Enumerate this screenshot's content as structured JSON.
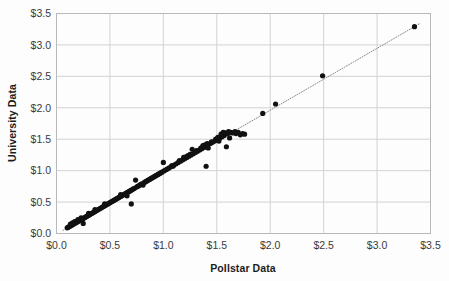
{
  "chart_data": {
    "type": "scatter",
    "title": "",
    "xlabel": "Pollstar Data",
    "ylabel": "University Data",
    "xlim": [
      0.0,
      3.5
    ],
    "ylim": [
      0.0,
      3.5
    ],
    "xticks": [
      0.0,
      0.5,
      1.0,
      1.5,
      2.0,
      2.5,
      3.0,
      3.5
    ],
    "yticks": [
      0.0,
      0.5,
      1.0,
      1.5,
      2.0,
      2.5,
      3.0,
      3.5
    ],
    "xticklabels": [
      "$0.0",
      "$0.5",
      "$1.0",
      "$1.5",
      "$2.0",
      "$2.5",
      "$3.0",
      "$3.5"
    ],
    "yticklabels": [
      "$0.0",
      "$0.5",
      "$1.0",
      "$1.5",
      "$2.0",
      "$2.5",
      "$3.0",
      "$3.5"
    ],
    "grid": true,
    "legend": null,
    "marker_color": "#111111",
    "grid_color": "#d2d2d2",
    "axis_color": "#b9b9b9",
    "trendline": {
      "style": "dotted",
      "color": "#8a8a8a",
      "x": [
        0.06,
        3.4
      ],
      "y": [
        0.05,
        3.34
      ]
    },
    "series": [
      {
        "name": "Ticket price pairs",
        "points": [
          [
            0.1,
            0.09
          ],
          [
            0.11,
            0.1
          ],
          [
            0.12,
            0.11
          ],
          [
            0.13,
            0.12
          ],
          [
            0.13,
            0.15
          ],
          [
            0.14,
            0.13
          ],
          [
            0.15,
            0.14
          ],
          [
            0.15,
            0.17
          ],
          [
            0.16,
            0.15
          ],
          [
            0.17,
            0.16
          ],
          [
            0.17,
            0.19
          ],
          [
            0.18,
            0.17
          ],
          [
            0.19,
            0.18
          ],
          [
            0.2,
            0.19
          ],
          [
            0.2,
            0.22
          ],
          [
            0.21,
            0.2
          ],
          [
            0.22,
            0.21
          ],
          [
            0.23,
            0.22
          ],
          [
            0.23,
            0.25
          ],
          [
            0.24,
            0.23
          ],
          [
            0.25,
            0.16
          ],
          [
            0.25,
            0.24
          ],
          [
            0.26,
            0.25
          ],
          [
            0.27,
            0.26
          ],
          [
            0.28,
            0.27
          ],
          [
            0.29,
            0.28
          ],
          [
            0.3,
            0.29
          ],
          [
            0.3,
            0.32
          ],
          [
            0.31,
            0.3
          ],
          [
            0.32,
            0.31
          ],
          [
            0.33,
            0.32
          ],
          [
            0.34,
            0.33
          ],
          [
            0.35,
            0.34
          ],
          [
            0.36,
            0.35
          ],
          [
            0.36,
            0.38
          ],
          [
            0.37,
            0.36
          ],
          [
            0.38,
            0.37
          ],
          [
            0.39,
            0.38
          ],
          [
            0.4,
            0.39
          ],
          [
            0.41,
            0.4
          ],
          [
            0.42,
            0.41
          ],
          [
            0.43,
            0.42
          ],
          [
            0.44,
            0.43
          ],
          [
            0.45,
            0.44
          ],
          [
            0.45,
            0.47
          ],
          [
            0.46,
            0.45
          ],
          [
            0.47,
            0.46
          ],
          [
            0.48,
            0.47
          ],
          [
            0.49,
            0.48
          ],
          [
            0.5,
            0.49
          ],
          [
            0.51,
            0.5
          ],
          [
            0.52,
            0.51
          ],
          [
            0.53,
            0.52
          ],
          [
            0.54,
            0.53
          ],
          [
            0.55,
            0.54
          ],
          [
            0.56,
            0.55
          ],
          [
            0.57,
            0.56
          ],
          [
            0.58,
            0.57
          ],
          [
            0.59,
            0.58
          ],
          [
            0.6,
            0.59
          ],
          [
            0.6,
            0.62
          ],
          [
            0.61,
            0.6
          ],
          [
            0.62,
            0.61
          ],
          [
            0.63,
            0.62
          ],
          [
            0.64,
            0.63
          ],
          [
            0.65,
            0.64
          ],
          [
            0.66,
            0.6
          ],
          [
            0.66,
            0.65
          ],
          [
            0.67,
            0.66
          ],
          [
            0.68,
            0.67
          ],
          [
            0.69,
            0.68
          ],
          [
            0.7,
            0.47
          ],
          [
            0.7,
            0.69
          ],
          [
            0.71,
            0.7
          ],
          [
            0.72,
            0.71
          ],
          [
            0.73,
            0.72
          ],
          [
            0.74,
            0.85
          ],
          [
            0.75,
            0.74
          ],
          [
            0.76,
            0.75
          ],
          [
            0.77,
            0.76
          ],
          [
            0.78,
            0.77
          ],
          [
            0.79,
            0.78
          ],
          [
            0.8,
            0.79
          ],
          [
            0.81,
            0.77
          ],
          [
            0.82,
            0.81
          ],
          [
            0.83,
            0.82
          ],
          [
            0.84,
            0.83
          ],
          [
            0.85,
            0.84
          ],
          [
            0.86,
            0.85
          ],
          [
            0.87,
            0.86
          ],
          [
            0.88,
            0.87
          ],
          [
            0.89,
            0.88
          ],
          [
            0.9,
            0.89
          ],
          [
            0.91,
            0.9
          ],
          [
            0.92,
            0.91
          ],
          [
            0.93,
            0.92
          ],
          [
            0.94,
            0.93
          ],
          [
            0.95,
            0.94
          ],
          [
            0.96,
            0.95
          ],
          [
            0.97,
            0.96
          ],
          [
            0.98,
            0.97
          ],
          [
            0.99,
            0.98
          ],
          [
            1.0,
            1.13
          ],
          [
            1.01,
            1.0
          ],
          [
            1.03,
            1.02
          ],
          [
            1.05,
            1.04
          ],
          [
            1.07,
            1.06
          ],
          [
            1.08,
            1.08
          ],
          [
            1.09,
            1.07
          ],
          [
            1.1,
            1.09
          ],
          [
            1.12,
            1.11
          ],
          [
            1.14,
            1.13
          ],
          [
            1.15,
            1.16
          ],
          [
            1.16,
            1.15
          ],
          [
            1.18,
            1.17
          ],
          [
            1.19,
            1.21
          ],
          [
            1.2,
            1.19
          ],
          [
            1.21,
            1.22
          ],
          [
            1.22,
            1.21
          ],
          [
            1.23,
            1.24
          ],
          [
            1.24,
            1.23
          ],
          [
            1.25,
            1.26
          ],
          [
            1.26,
            1.25
          ],
          [
            1.27,
            1.34
          ],
          [
            1.28,
            1.27
          ],
          [
            1.3,
            1.29
          ],
          [
            1.31,
            1.32
          ],
          [
            1.32,
            1.31
          ],
          [
            1.34,
            1.33
          ],
          [
            1.35,
            1.36
          ],
          [
            1.36,
            1.35
          ],
          [
            1.37,
            1.4
          ],
          [
            1.38,
            1.37
          ],
          [
            1.39,
            1.41
          ],
          [
            1.4,
            1.07
          ],
          [
            1.4,
            1.39
          ],
          [
            1.41,
            1.43
          ],
          [
            1.42,
            1.36
          ],
          [
            1.44,
            1.43
          ],
          [
            1.45,
            1.46
          ],
          [
            1.46,
            1.45
          ],
          [
            1.48,
            1.47
          ],
          [
            1.49,
            1.5
          ],
          [
            1.5,
            1.49
          ],
          [
            1.51,
            1.53
          ],
          [
            1.52,
            1.47
          ],
          [
            1.53,
            1.52
          ],
          [
            1.54,
            1.58
          ],
          [
            1.55,
            1.54
          ],
          [
            1.56,
            1.61
          ],
          [
            1.57,
            1.56
          ],
          [
            1.58,
            1.6
          ],
          [
            1.59,
            1.38
          ],
          [
            1.6,
            1.59
          ],
          [
            1.61,
            1.62
          ],
          [
            1.62,
            1.52
          ],
          [
            1.63,
            1.61
          ],
          [
            1.65,
            1.6
          ],
          [
            1.67,
            1.62
          ],
          [
            1.68,
            1.59
          ],
          [
            1.7,
            1.61
          ],
          [
            1.72,
            1.57
          ],
          [
            1.74,
            1.59
          ],
          [
            1.76,
            1.58
          ],
          [
            1.93,
            1.91
          ],
          [
            2.05,
            2.06
          ],
          [
            2.49,
            2.51
          ],
          [
            3.35,
            3.29
          ]
        ]
      }
    ]
  },
  "axis": {
    "x_title": "Pollstar Data",
    "y_title": "University Data"
  }
}
